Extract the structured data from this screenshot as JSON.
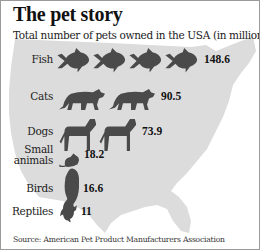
{
  "chart_data": {
    "type": "bar",
    "style": "pictogram",
    "title": "The pet story",
    "subtitle": "Total number of pets owned in the USA (in millions):",
    "source": "Source: American Pet Product Manufacturers Association",
    "categories": [
      "Fish",
      "Cats",
      "Dogs",
      "Small animals",
      "Birds",
      "Reptiles"
    ],
    "category_lines": [
      [
        "Fish"
      ],
      [
        "Cats"
      ],
      [
        "Dogs"
      ],
      [
        "Small",
        "animals"
      ],
      [
        "Birds"
      ],
      [
        "Reptiles"
      ]
    ],
    "values": [
      148.6,
      90.5,
      73.9,
      18.2,
      16.6,
      11
    ],
    "value_labels": [
      "148.6",
      "90.5",
      "73.9",
      "18.2",
      "16.6",
      "11"
    ],
    "icons": [
      "fish-icon",
      "cat-icon",
      "dog-icon",
      "mouse-icon",
      "bird-icon",
      "turtle-icon"
    ],
    "icon_counts": [
      4,
      2,
      2,
      1,
      1,
      1
    ],
    "background": "map of the USA",
    "xlabel": "",
    "ylabel": "",
    "unit": "millions"
  },
  "colors": {
    "icon": "#4a4a4a",
    "map": "#dcdcdc",
    "text": "#222222"
  }
}
